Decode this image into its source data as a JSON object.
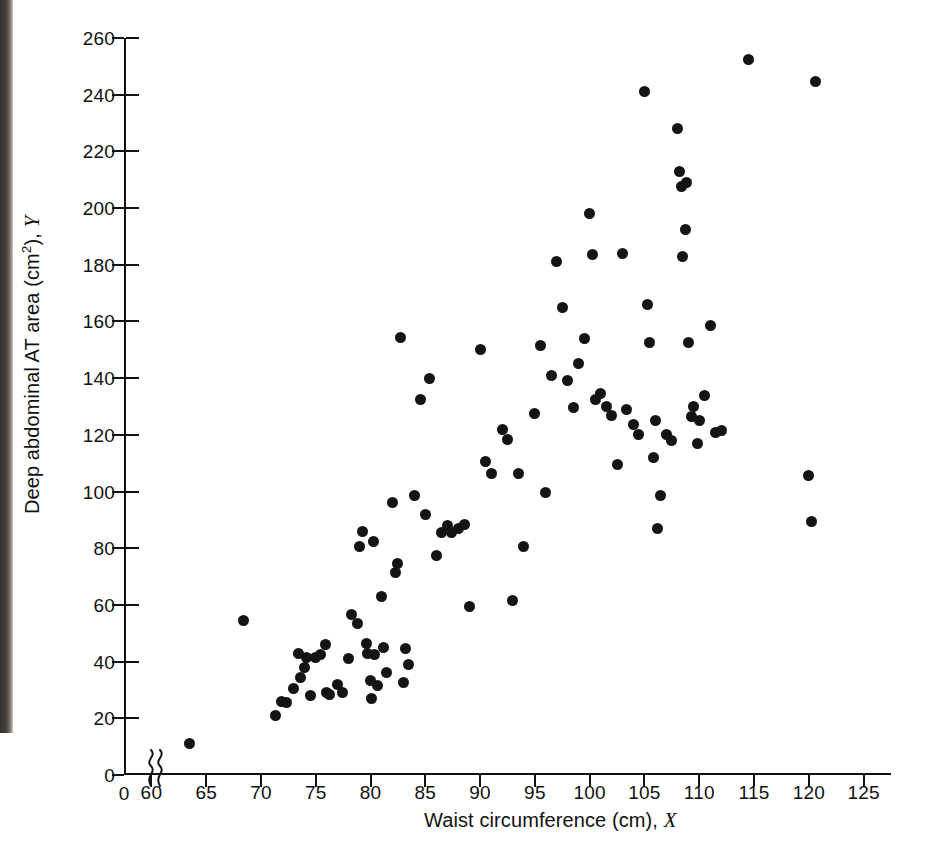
{
  "figure": {
    "background_color": "#ffffff",
    "point_color": "#141414",
    "axis_color": "#121212"
  },
  "axes": {
    "x_title_text": "Waist circumference (cm), ",
    "x_title_var": "X",
    "y_title_text": "Deep abdominal AT area (cm",
    "y_title_sup": "2",
    "y_title_tail": "), ",
    "y_title_var": "Y",
    "x_origin_label": "0",
    "x_ticks": [
      "60",
      "65",
      "70",
      "75",
      "80",
      "85",
      "90",
      "95",
      "100",
      "105",
      "110",
      "115",
      "120",
      "125"
    ],
    "y_ticks": [
      "0",
      "20",
      "40",
      "60",
      "80",
      "100",
      "120",
      "140",
      "160",
      "180",
      "200",
      "220",
      "240",
      "260"
    ],
    "axis_break_symbol": "axis-break-squiggle"
  },
  "chart_data": {
    "type": "scatter",
    "title": "",
    "xlabel": "Waist circumference (cm), X",
    "ylabel": "Deep abdominal AT area (cm2), Y",
    "xlim": [
      57.5,
      127.5
    ],
    "ylim": [
      0,
      260
    ],
    "xticks": [
      60,
      65,
      70,
      75,
      80,
      85,
      90,
      95,
      100,
      105,
      110,
      115,
      120,
      125
    ],
    "yticks": [
      0,
      20,
      40,
      60,
      80,
      100,
      120,
      140,
      160,
      180,
      200,
      220,
      240,
      260
    ],
    "grid": false,
    "legend": null,
    "axis_break_x": [
      0,
      60
    ],
    "n_points": 109,
    "series": [
      {
        "name": "subjects",
        "marker": "filled-circle",
        "color": "#141414",
        "points": [
          [
            63.5,
            11.0
          ],
          [
            68.4,
            54.5
          ],
          [
            71.3,
            21.0
          ],
          [
            71.9,
            26.0
          ],
          [
            72.3,
            25.5
          ],
          [
            73.0,
            30.5
          ],
          [
            73.4,
            43.0
          ],
          [
            73.6,
            34.5
          ],
          [
            74.0,
            38.0
          ],
          [
            74.2,
            41.5
          ],
          [
            74.5,
            28.0
          ],
          [
            75.0,
            41.5
          ],
          [
            75.4,
            42.5
          ],
          [
            75.9,
            46.0
          ],
          [
            76.0,
            29.0
          ],
          [
            76.3,
            28.5
          ],
          [
            77.0,
            32.0
          ],
          [
            77.4,
            29.0
          ],
          [
            78.0,
            41.0
          ],
          [
            78.3,
            56.5
          ],
          [
            78.8,
            53.5
          ],
          [
            79.0,
            80.5
          ],
          [
            79.3,
            86.0
          ],
          [
            79.6,
            46.5
          ],
          [
            79.7,
            43.0
          ],
          [
            80.0,
            33.5
          ],
          [
            80.1,
            27.0
          ],
          [
            80.3,
            82.5
          ],
          [
            80.4,
            42.5
          ],
          [
            80.6,
            31.5
          ],
          [
            81.0,
            63.0
          ],
          [
            81.2,
            45.0
          ],
          [
            81.5,
            36.0
          ],
          [
            82.0,
            96.0
          ],
          [
            82.3,
            71.5
          ],
          [
            82.5,
            74.5
          ],
          [
            82.7,
            154.5
          ],
          [
            83.0,
            32.5
          ],
          [
            83.2,
            44.5
          ],
          [
            83.5,
            39.0
          ],
          [
            84.0,
            98.5
          ],
          [
            84.6,
            132.5
          ],
          [
            85.0,
            92.0
          ],
          [
            85.4,
            140.0
          ],
          [
            86.0,
            77.5
          ],
          [
            86.5,
            85.5
          ],
          [
            87.0,
            88.0
          ],
          [
            87.4,
            85.5
          ],
          [
            88.0,
            87.0
          ],
          [
            88.6,
            88.5
          ],
          [
            89.0,
            59.5
          ],
          [
            90.0,
            150.0
          ],
          [
            90.5,
            110.5
          ],
          [
            91.0,
            106.5
          ],
          [
            92.0,
            122.0
          ],
          [
            92.5,
            118.5
          ],
          [
            93.0,
            61.5
          ],
          [
            93.5,
            106.5
          ],
          [
            94.0,
            80.5
          ],
          [
            95.0,
            127.5
          ],
          [
            95.5,
            151.5
          ],
          [
            96.0,
            99.5
          ],
          [
            96.5,
            141.0
          ],
          [
            97.0,
            181.0
          ],
          [
            97.5,
            165.0
          ],
          [
            98.0,
            139.0
          ],
          [
            98.5,
            129.5
          ],
          [
            99.0,
            145.0
          ],
          [
            99.5,
            154.0
          ],
          [
            100.0,
            198.0
          ],
          [
            100.3,
            183.5
          ],
          [
            100.5,
            132.5
          ],
          [
            101.0,
            134.5
          ],
          [
            101.5,
            130.0
          ],
          [
            102.0,
            127.0
          ],
          [
            102.5,
            109.5
          ],
          [
            103.0,
            184.0
          ],
          [
            103.4,
            129.0
          ],
          [
            104.0,
            123.5
          ],
          [
            104.5,
            120.0
          ],
          [
            105.0,
            241.0
          ],
          [
            105.3,
            166.0
          ],
          [
            105.5,
            152.5
          ],
          [
            105.8,
            112.0
          ],
          [
            106.0,
            125.0
          ],
          [
            106.2,
            87.0
          ],
          [
            106.5,
            98.5
          ],
          [
            107.0,
            120.0
          ],
          [
            107.5,
            118.0
          ],
          [
            108.0,
            228.0
          ],
          [
            108.2,
            213.0
          ],
          [
            108.4,
            207.5
          ],
          [
            108.5,
            183.0
          ],
          [
            108.7,
            192.5
          ],
          [
            108.8,
            209.0
          ],
          [
            109.0,
            152.5
          ],
          [
            109.3,
            126.5
          ],
          [
            109.5,
            130.0
          ],
          [
            109.8,
            117.0
          ],
          [
            110.0,
            125.0
          ],
          [
            110.5,
            134.0
          ],
          [
            111.0,
            158.5
          ],
          [
            111.5,
            121.0
          ],
          [
            112.0,
            121.5
          ],
          [
            114.5,
            252.5
          ],
          [
            120.0,
            105.5
          ],
          [
            120.2,
            89.5
          ],
          [
            120.6,
            244.5
          ]
        ]
      }
    ]
  },
  "ghost_text": {
    "line_a": "",
    "line_b": ""
  }
}
